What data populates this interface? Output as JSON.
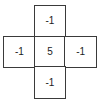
{
  "figure": {
    "type": "kernel-matrix",
    "shape": "plus",
    "grid_rows": 3,
    "grid_cols": 3,
    "line_color": "#3a3a3a",
    "text_color": "#1c1c1c",
    "background": "#ffffff",
    "cells": [
      {
        "row": 0,
        "col": 0,
        "visible": false,
        "value": ""
      },
      {
        "row": 0,
        "col": 1,
        "visible": true,
        "value": "-1"
      },
      {
        "row": 0,
        "col": 2,
        "visible": false,
        "value": ""
      },
      {
        "row": 1,
        "col": 0,
        "visible": true,
        "value": "-1"
      },
      {
        "row": 1,
        "col": 1,
        "visible": true,
        "value": "5"
      },
      {
        "row": 1,
        "col": 2,
        "visible": true,
        "value": "-1"
      },
      {
        "row": 2,
        "col": 0,
        "visible": false,
        "value": ""
      },
      {
        "row": 2,
        "col": 1,
        "visible": true,
        "value": "-1"
      },
      {
        "row": 2,
        "col": 2,
        "visible": false,
        "value": ""
      }
    ]
  },
  "chart_data": {
    "type": "heatmap",
    "title": "",
    "xlabel": "",
    "ylabel": "",
    "categories": [
      "col0",
      "col1",
      "col2"
    ],
    "rows": [
      "row0",
      "row1",
      "row2"
    ],
    "values": [
      [
        null,
        -1,
        null
      ],
      [
        -1,
        5,
        -1
      ],
      [
        null,
        -1,
        null
      ]
    ]
  }
}
